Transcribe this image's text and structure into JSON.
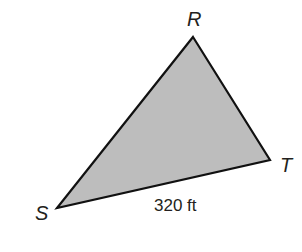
{
  "diagram": {
    "type": "triangle",
    "fill_color": "#bdbdbd",
    "stroke_color": "#111111",
    "vertices": [
      {
        "name": "R",
        "x": 193,
        "y": 37
      },
      {
        "name": "T",
        "x": 270,
        "y": 160
      },
      {
        "name": "S",
        "x": 57,
        "y": 208
      }
    ],
    "labels": {
      "R": "R",
      "T": "T",
      "S": "S",
      "side_ST": "320 ft"
    }
  }
}
